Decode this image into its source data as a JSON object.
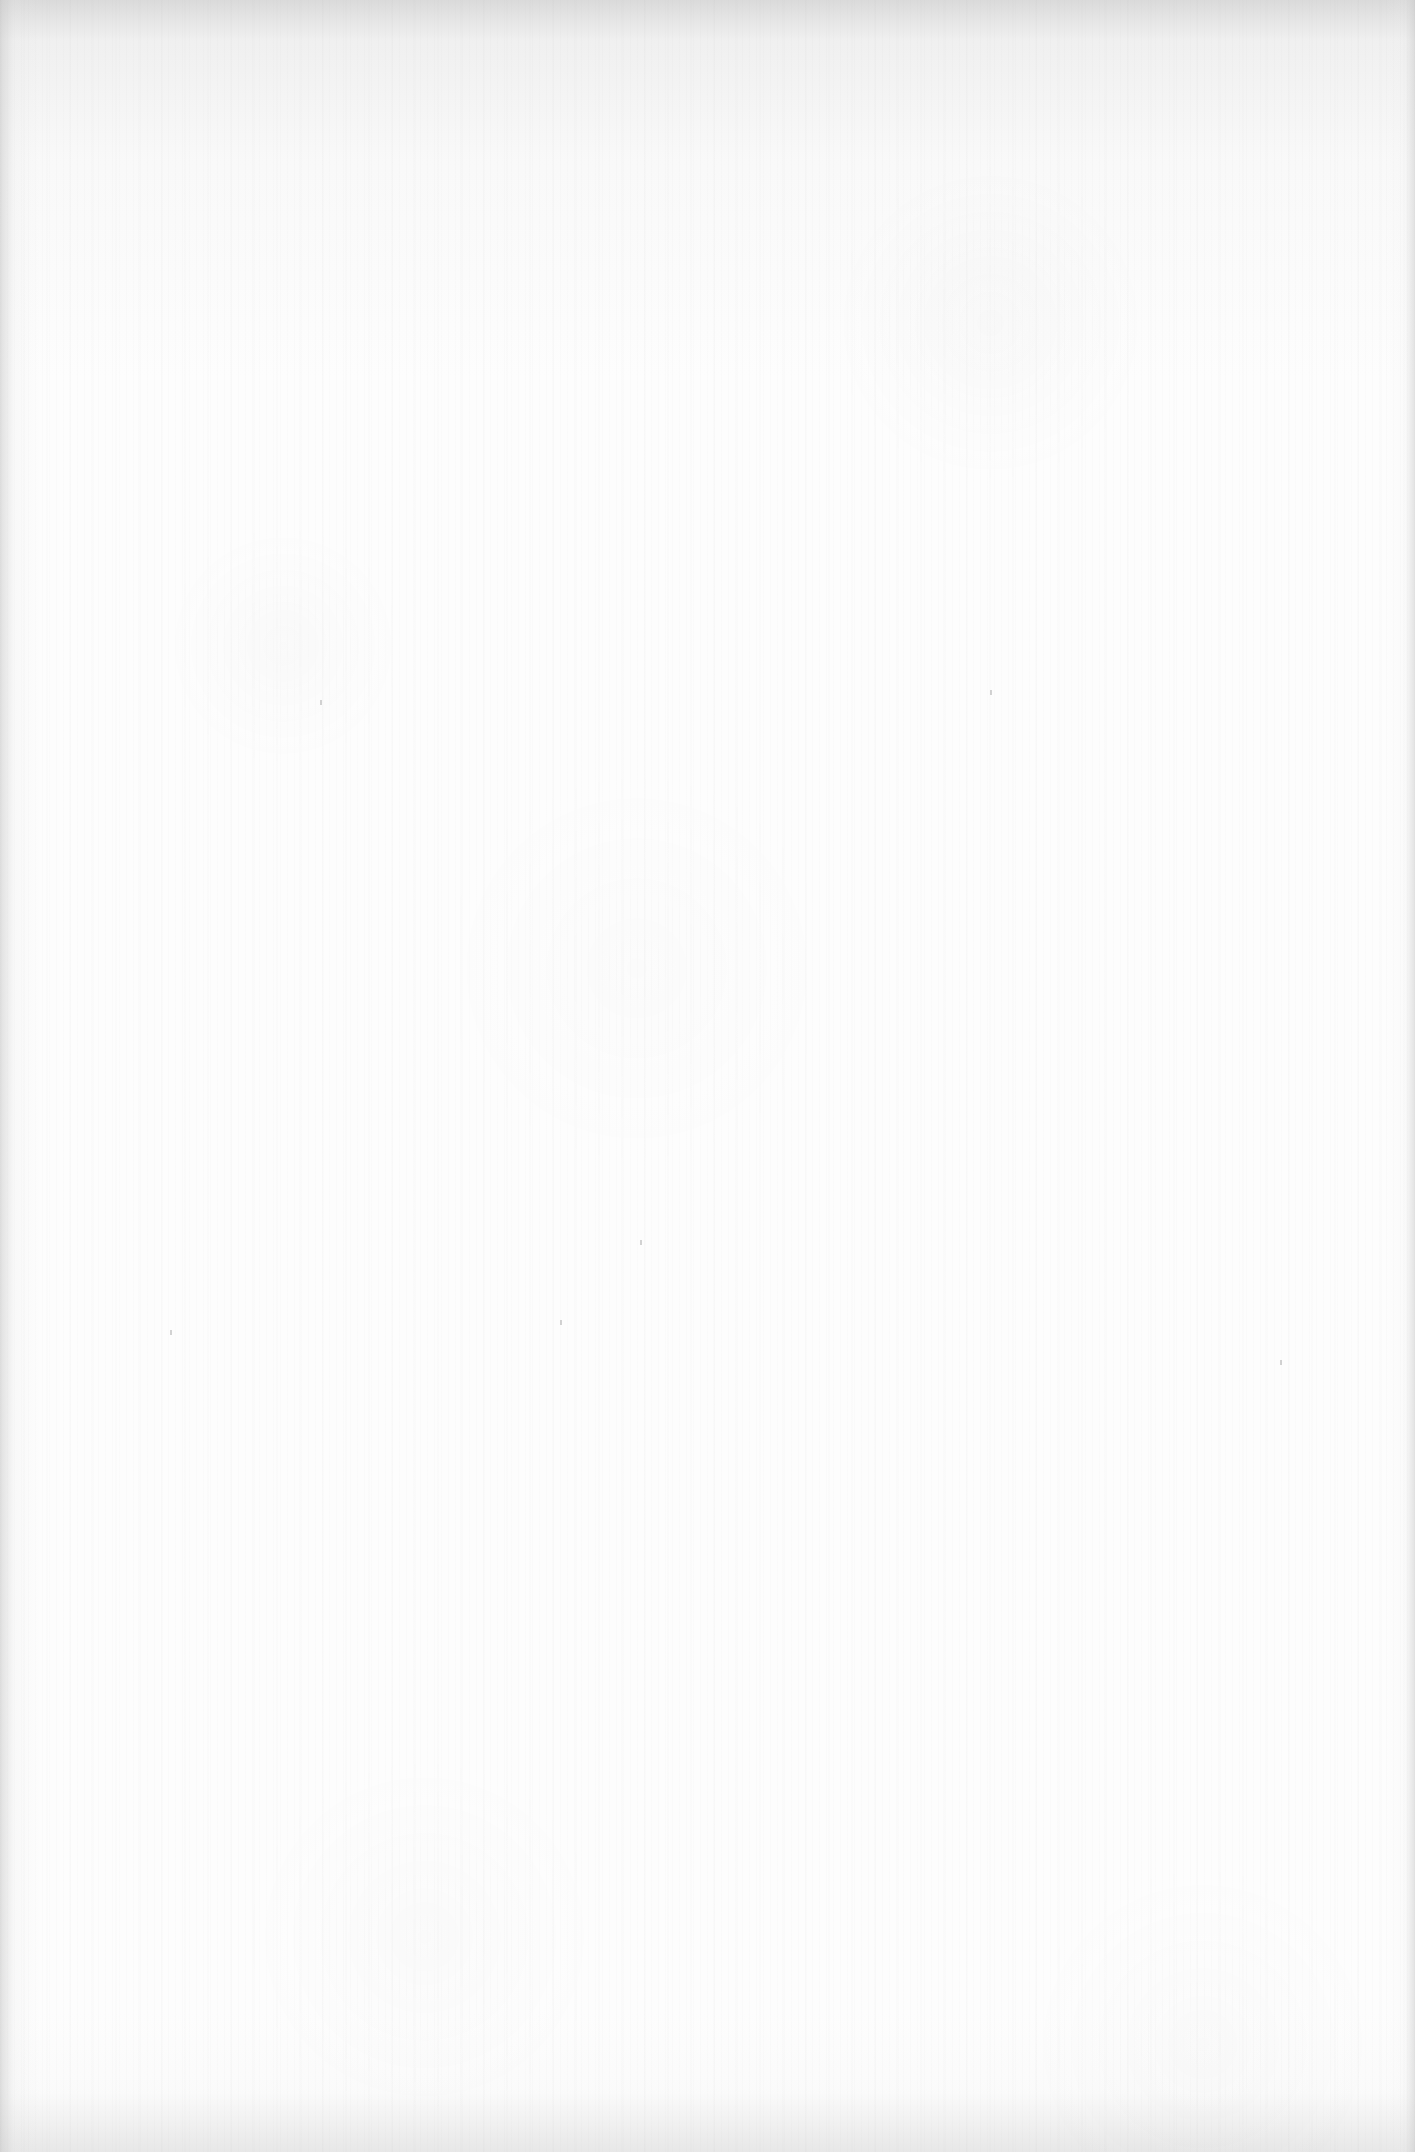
{
  "page": {
    "type": "blank-scanned-page",
    "content_text": "",
    "background_color": "#fdfdfd",
    "edge_shade_color": "#c8c8c8"
  }
}
